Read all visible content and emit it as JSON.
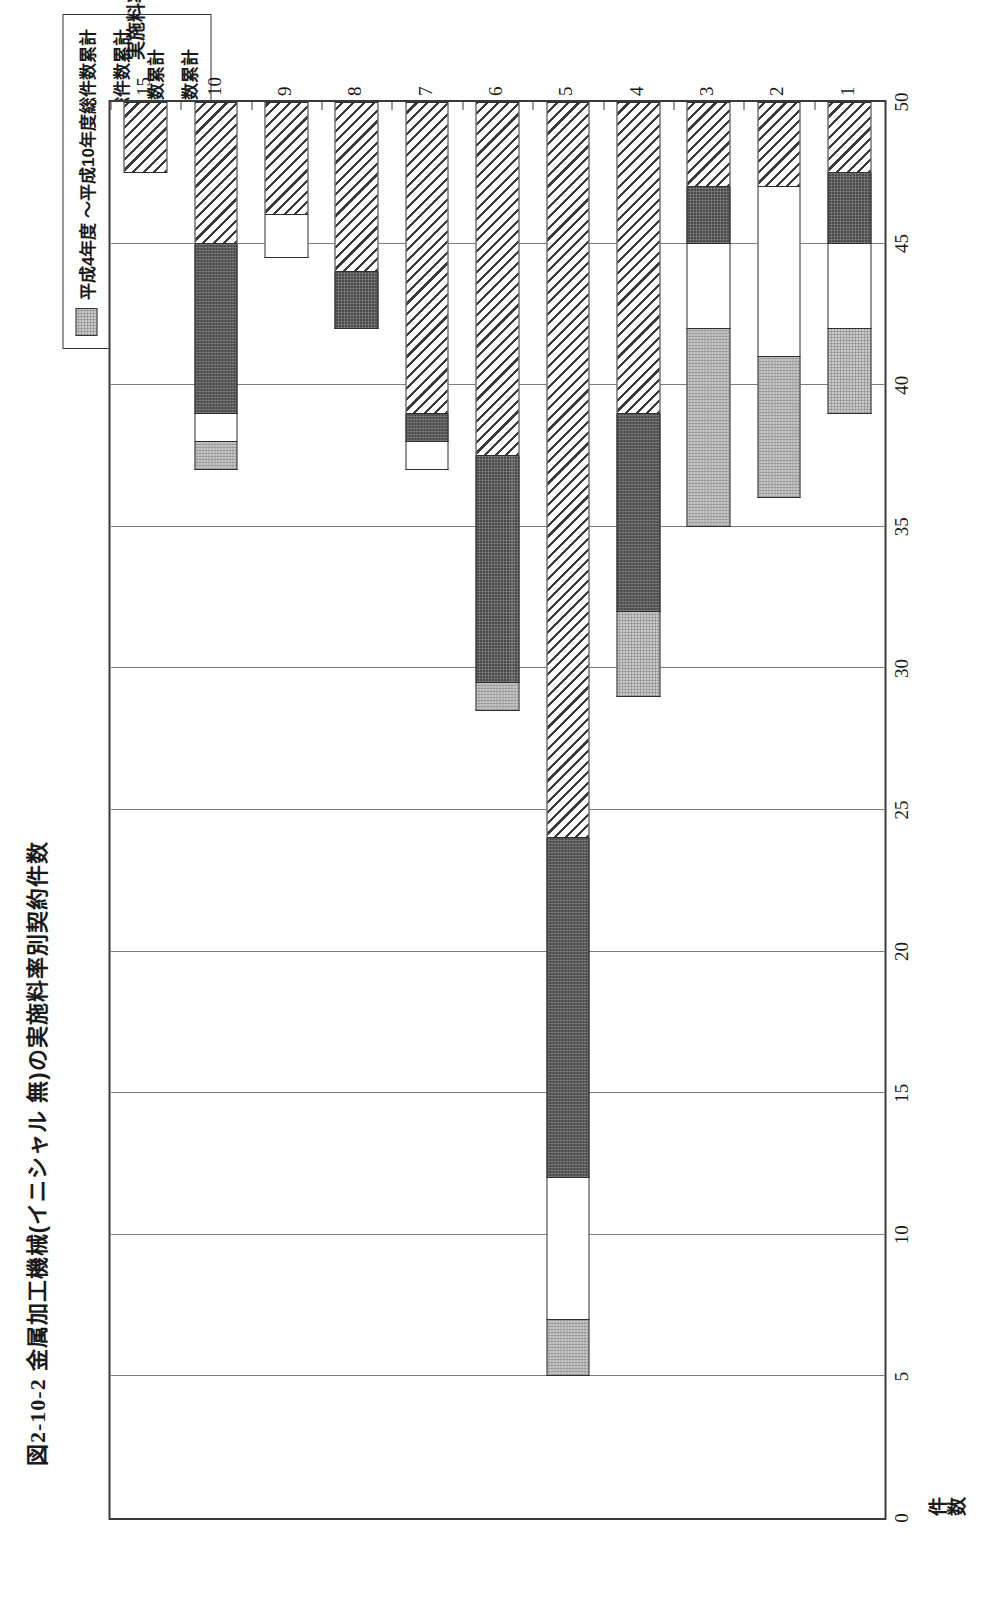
{
  "figure": {
    "number": "図2-10-2",
    "title": "金属加工機械(イニシャル 無)の実施料率別契約件数",
    "full_title": "図2-10-2 金属加工機械(イニシャル 無)の実施料率別契約件数"
  },
  "legend": {
    "items": [
      {
        "swatch": "gray-checker",
        "label": "平成4年度 ～平成10年度総件数累計"
      },
      {
        "swatch": "white-plain",
        "label": "昭和63年度 ～平成3年度総件数累計"
      },
      {
        "swatch": "dark-checker",
        "label": "昭和49年 ～昭和52年 総件数累計"
      },
      {
        "swatch": "diagonal-hatch",
        "label": "昭和43年 ～昭和48年 総件数累計"
      }
    ]
  },
  "axes": {
    "value_axis_title": "件数",
    "value_ticks": [
      "0",
      "5",
      "10",
      "15",
      "20",
      "25",
      "30",
      "35",
      "40",
      "45",
      "50"
    ],
    "category_axis_title": "実施料率(%)",
    "category_ticks": [
      "1",
      "2",
      "3",
      "4",
      "5",
      "6",
      "7",
      "8",
      "9",
      "10",
      "15"
    ]
  },
  "chart_data": {
    "type": "bar",
    "orientation": "horizontal",
    "stacked": true,
    "title": "図2-10-2 金属加工機械(イニシャル 無)の実施料率別契約件数",
    "xlabel": "件数",
    "ylabel": "実施料率(%)",
    "xlim": [
      0,
      50
    ],
    "xticks": [
      0,
      5,
      10,
      15,
      20,
      25,
      30,
      35,
      40,
      45,
      50
    ],
    "grid": true,
    "legend_position": "top-right-outside",
    "categories": [
      "1",
      "2",
      "3",
      "4",
      "5",
      "6",
      "7",
      "8",
      "9",
      "10",
      "15"
    ],
    "series": [
      {
        "name": "昭和43年 ～昭和48年 総件数累計",
        "pattern": "diagonal-hatch",
        "values": [
          2.5,
          3,
          3,
          11,
          26,
          12.5,
          11,
          6,
          4,
          5,
          2.5
        ]
      },
      {
        "name": "昭和49年 ～昭和52年 総件数累計",
        "pattern": "dark-checker",
        "values": [
          2.5,
          0,
          2,
          7,
          12,
          8,
          1,
          2,
          0,
          6,
          0
        ]
      },
      {
        "name": "昭和63年度 ～平成3年度総件数累計",
        "pattern": "white-plain",
        "values": [
          3,
          6,
          3,
          0,
          5,
          0,
          1,
          0,
          1.5,
          1,
          0
        ]
      },
      {
        "name": "平成4年度 ～平成10年度総件数累計",
        "pattern": "gray-checker",
        "values": [
          3,
          5,
          7,
          3,
          2,
          1,
          0,
          0,
          0,
          1,
          0
        ]
      }
    ],
    "totals": [
      11,
      14,
      15,
      21,
      45,
      21.5,
      13,
      8,
      5.5,
      13,
      2.5
    ]
  }
}
